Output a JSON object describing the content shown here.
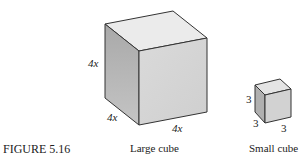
{
  "figure": {
    "label": "FIGURE 5.16"
  },
  "large_cube": {
    "caption": "Large cube",
    "height_label": "4x",
    "depth_label": "4x",
    "width_label": "4x",
    "colors": {
      "top": "#e9e9e9",
      "left": "#b5b5b5",
      "front": "#d6d6d6",
      "edge": "#333333"
    }
  },
  "small_cube": {
    "caption": "Small cube",
    "height_label": "3",
    "depth_label": "3",
    "width_label": "3",
    "colors": {
      "top": "#e4e4e4",
      "left": "#b0b0b0",
      "front": "#d2d2d2",
      "edge": "#333333"
    }
  }
}
